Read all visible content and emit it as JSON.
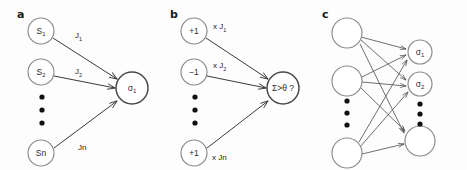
{
  "figure": {
    "width": 467,
    "height": 170,
    "background": "#fdfdfd",
    "panels": [
      {
        "letter": "a",
        "letter_x": 17,
        "letter_y": 18,
        "input_nodes": [
          {
            "label": "S",
            "sub": "1",
            "cx": 41,
            "cy": 31,
            "r": 13
          },
          {
            "label": "S",
            "sub": "2",
            "cx": 41,
            "cy": 72,
            "r": 13
          },
          {
            "label": "Sn",
            "sub": "",
            "cx": 41,
            "cy": 153,
            "r": 13
          }
        ],
        "output_nodes": [
          {
            "label": "σ",
            "sub": "1",
            "cx": 132,
            "cy": 88,
            "r": 16
          }
        ],
        "edges": [
          {
            "x1": 53,
            "y1": 38,
            "x2": 117,
            "y2": 79
          },
          {
            "x1": 54,
            "y1": 76,
            "x2": 115,
            "y2": 88
          },
          {
            "x1": 54,
            "y1": 148,
            "x2": 117,
            "y2": 101
          }
        ],
        "weights": [
          {
            "text": "J",
            "sub": "1",
            "x": 75,
            "y": 38
          },
          {
            "text": "J",
            "sub": "2",
            "x": 75,
            "y": 74
          },
          {
            "text": "Jn",
            "sub": "",
            "x": 78,
            "y": 150
          }
        ],
        "ellipsis": [
          {
            "cx": 42,
            "cy": 97
          },
          {
            "cx": 42,
            "cy": 110
          },
          {
            "cx": 42,
            "cy": 123
          }
        ]
      },
      {
        "letter": "b",
        "letter_x": 170,
        "letter_y": 18,
        "input_nodes": [
          {
            "label": "+1",
            "sub": "",
            "cx": 194,
            "cy": 31,
            "r": 13
          },
          {
            "label": "−1",
            "sub": "",
            "cx": 194,
            "cy": 72,
            "r": 13
          },
          {
            "label": "+1",
            "sub": "",
            "cx": 194,
            "cy": 153,
            "r": 13
          }
        ],
        "output_nodes": [
          {
            "label": "Σ>θ ?",
            "sub": "",
            "cx": 283,
            "cy": 88,
            "r": 16
          }
        ],
        "edges": [
          {
            "x1": 206,
            "y1": 38,
            "x2": 268,
            "y2": 79
          },
          {
            "x1": 207,
            "y1": 76,
            "x2": 266,
            "y2": 88
          },
          {
            "x1": 207,
            "y1": 148,
            "x2": 268,
            "y2": 101
          }
        ],
        "weights": [
          {
            "text": "x J",
            "sub": "1",
            "x": 213,
            "y": 29
          },
          {
            "text": "x J",
            "sub": "2",
            "x": 213,
            "y": 68
          },
          {
            "text": "x Jn",
            "sub": "",
            "x": 212,
            "y": 160
          }
        ],
        "ellipsis": [
          {
            "cx": 195,
            "cy": 97
          },
          {
            "cx": 195,
            "cy": 110
          },
          {
            "cx": 195,
            "cy": 123
          }
        ]
      },
      {
        "letter": "c",
        "letter_x": 322,
        "letter_y": 18,
        "input_nodes": [
          {
            "label": "",
            "sub": "",
            "cx": 347,
            "cy": 33,
            "r": 15
          },
          {
            "label": "",
            "sub": "",
            "cx": 347,
            "cy": 81,
            "r": 15
          },
          {
            "label": "",
            "sub": "",
            "cx": 347,
            "cy": 153,
            "r": 15
          }
        ],
        "output_nodes": [
          {
            "label": "σ",
            "sub": "1",
            "cx": 420,
            "cy": 52,
            "r": 12
          },
          {
            "label": "σ",
            "sub": "2",
            "cx": 420,
            "cy": 84,
            "r": 12
          },
          {
            "label": "",
            "sub": "",
            "cx": 420,
            "cy": 141,
            "r": 15
          }
        ],
        "edges": [
          {
            "x1": 361,
            "y1": 37,
            "x2": 406,
            "y2": 49
          },
          {
            "x1": 361,
            "y1": 40,
            "x2": 406,
            "y2": 80
          },
          {
            "x1": 360,
            "y1": 44,
            "x2": 404,
            "y2": 133
          },
          {
            "x1": 362,
            "y1": 77,
            "x2": 406,
            "y2": 55
          },
          {
            "x1": 362,
            "y1": 82,
            "x2": 406,
            "y2": 86
          },
          {
            "x1": 361,
            "y1": 88,
            "x2": 405,
            "y2": 131
          },
          {
            "x1": 359,
            "y1": 142,
            "x2": 407,
            "y2": 60
          },
          {
            "x1": 360,
            "y1": 147,
            "x2": 408,
            "y2": 92
          },
          {
            "x1": 362,
            "y1": 154,
            "x2": 404,
            "y2": 144
          }
        ],
        "weights": [],
        "ellipsis": [
          {
            "cx": 347,
            "cy": 101
          },
          {
            "cx": 347,
            "cy": 113
          },
          {
            "cx": 347,
            "cy": 125
          }
        ],
        "ellipsis_right": [
          {
            "cx": 420,
            "cy": 104
          },
          {
            "cx": 420,
            "cy": 114
          },
          {
            "cx": 420,
            "cy": 124
          }
        ]
      }
    ]
  },
  "colors": {
    "node_stroke": "#8a8a8a",
    "node_stroke_dark": "#4a4a4a",
    "edge": "#3a3a3a",
    "text": "#1a1a1a",
    "background": "#fdfdfd"
  }
}
